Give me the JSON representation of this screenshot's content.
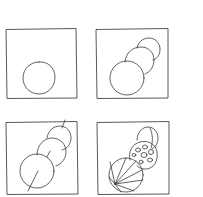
{
  "figure": {
    "panels": [
      {
        "step": 1,
        "position": "top-left",
        "content": "single circle"
      },
      {
        "step": 2,
        "position": "top-right",
        "content": "three stacked overlapping circles"
      },
      {
        "step": 3,
        "position": "bottom-left",
        "content": "three stacked circles with diagonal axis guideline"
      },
      {
        "step": 4,
        "position": "bottom-right",
        "content": "detailed figure with segmented large circle and spotted middle circle"
      }
    ],
    "colors": {
      "background": "#ffffff",
      "ink": "#3a3a3a"
    }
  }
}
